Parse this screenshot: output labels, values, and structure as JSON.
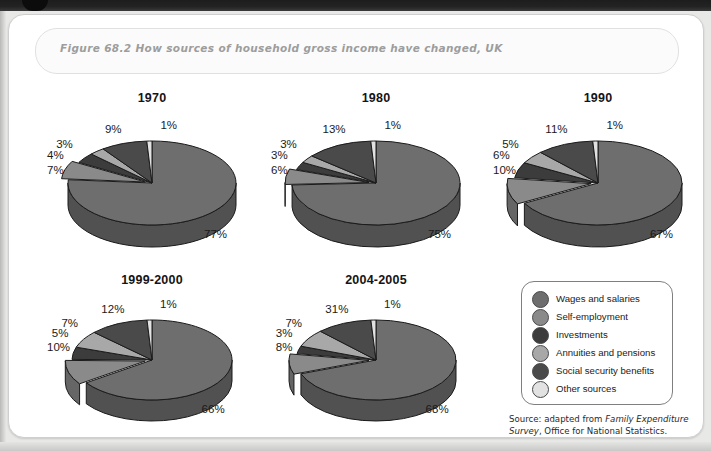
{
  "figure": {
    "caption": "Figure 68.2  How sources of household gross income have changed, UK",
    "source_prefix": "Source: adapted from ",
    "source_italic": "Family Expenditure Survey",
    "source_suffix": ", Office for National Statistics."
  },
  "legend": {
    "items": [
      {
        "label": "Wages and salaries",
        "color": "#6e6e6e"
      },
      {
        "label": "Self-employment",
        "color": "#8a8a8a"
      },
      {
        "label": "Investments",
        "color": "#3c3c3c"
      },
      {
        "label": "Annuities and pensions",
        "color": "#a8a8a8"
      },
      {
        "label": "Social security benefits",
        "color": "#4a4a4a"
      },
      {
        "label": "Other sources",
        "color": "#e2e2e2"
      }
    ]
  },
  "chart_data": {
    "type": "pie",
    "title": "Figure 68.2  How sources of household gross income have changed, UK",
    "value_unit": "%",
    "categories": [
      "Wages and salaries",
      "Self-employment",
      "Investments",
      "Annuities and pensions",
      "Social security benefits",
      "Other sources"
    ],
    "colors": [
      "#6e6e6e",
      "#8a8a8a",
      "#3c3c3c",
      "#a8a8a8",
      "#4a4a4a",
      "#e2e2e2"
    ],
    "legend_position": "bottom-right",
    "grid": false,
    "charts": [
      {
        "title": "1970",
        "values": [
          77,
          7,
          4,
          3,
          9,
          1
        ],
        "labels": [
          "77%",
          "7%",
          "4%",
          "3%",
          "9%",
          "1%"
        ],
        "exploded_index": 1
      },
      {
        "title": "1980",
        "values": [
          75,
          6,
          3,
          3,
          13,
          1
        ],
        "labels": [
          "75%",
          "6%",
          "3%",
          "3%",
          "13%",
          "1%"
        ],
        "exploded_index": 1
      },
      {
        "title": "1990",
        "values": [
          67,
          10,
          6,
          5,
          11,
          1
        ],
        "labels": [
          "67%",
          "10%",
          "6%",
          "5%",
          "11%",
          "1%"
        ],
        "exploded_index": 1
      },
      {
        "title": "1999-2000",
        "values": [
          66,
          10,
          5,
          7,
          12,
          1
        ],
        "labels": [
          "66%",
          "10%",
          "5%",
          "7%",
          "12%",
          "1%"
        ],
        "exploded_index": 1
      },
      {
        "title": "2004-2005",
        "values": [
          68,
          8,
          3,
          7,
          11,
          1
        ],
        "labels": [
          "68%",
          "8%",
          "3%",
          "7%",
          "31%",
          "1%"
        ],
        "exploded_index": 1
      }
    ]
  },
  "layout": {
    "pies": [
      {
        "left": 38,
        "top": 76,
        "w": 210,
        "h": 180,
        "r": 84,
        "depth": 22,
        "flat": 0.5
      },
      {
        "left": 262,
        "top": 76,
        "w": 210,
        "h": 180,
        "r": 84,
        "depth": 22,
        "flat": 0.5
      },
      {
        "left": 484,
        "top": 76,
        "w": 210,
        "h": 180,
        "r": 84,
        "depth": 22,
        "flat": 0.5
      },
      {
        "left": 38,
        "top": 258,
        "w": 210,
        "h": 170,
        "r": 80,
        "depth": 21,
        "flat": 0.5
      },
      {
        "left": 262,
        "top": 258,
        "w": 210,
        "h": 170,
        "r": 80,
        "depth": 21,
        "flat": 0.5
      }
    ]
  }
}
